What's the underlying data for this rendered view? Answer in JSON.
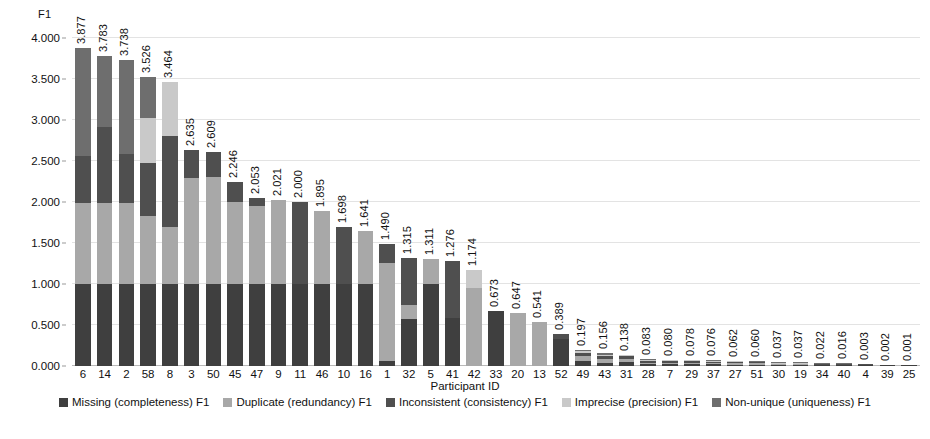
{
  "chart_data": {
    "type": "bar",
    "subtype": "stacked-bar",
    "title": "",
    "xlabel": "Participant ID",
    "ylabel": "F1",
    "ylim": [
      0.0,
      4.0
    ],
    "ytick_labels": [
      "0.000",
      "0.500",
      "1.000",
      "1.500",
      "2.000",
      "2.500",
      "3.000",
      "3.500",
      "4.000"
    ],
    "ytick_values": [
      0.0,
      0.5,
      1.0,
      1.5,
      2.0,
      2.5,
      3.0,
      3.5,
      4.0
    ],
    "grid": true,
    "legend_position": "bottom",
    "categories": [
      "6",
      "14",
      "2",
      "58",
      "8",
      "3",
      "50",
      "45",
      "47",
      "9",
      "11",
      "46",
      "10",
      "16",
      "1",
      "32",
      "5",
      "41",
      "42",
      "33",
      "20",
      "13",
      "52",
      "49",
      "43",
      "31",
      "28",
      "7",
      "29",
      "37",
      "27",
      "51",
      "30",
      "19",
      "34",
      "40",
      "4",
      "39",
      "25"
    ],
    "totals": [
      3.877,
      3.783,
      3.738,
      3.526,
      3.464,
      2.635,
      2.609,
      2.246,
      2.053,
      2.021,
      2.0,
      1.895,
      1.698,
      1.641,
      1.49,
      1.315,
      1.311,
      1.276,
      1.174,
      0.673,
      0.647,
      0.541,
      0.389,
      0.197,
      0.156,
      0.138,
      0.083,
      0.08,
      0.078,
      0.076,
      0.062,
      0.06,
      0.037,
      0.037,
      0.022,
      0.016,
      0.003,
      0.002,
      0.001
    ],
    "total_labels": [
      "3.877",
      "3.783",
      "3.738",
      "3.526",
      "3.464",
      "2.635",
      "2.609",
      "2.246",
      "2.053",
      "2.021",
      "2.000",
      "1.895",
      "1.698",
      "1.641",
      "1.490",
      "1.315",
      "1.311",
      "1.276",
      "1.174",
      "0.673",
      "0.647",
      "0.541",
      "0.389",
      "0.197",
      "0.156",
      "0.138",
      "0.083",
      "0.080",
      "0.078",
      "0.076",
      "0.062",
      "0.060",
      "0.037",
      "0.037",
      "0.022",
      "0.016",
      "0.003",
      "0.002",
      "0.001"
    ],
    "series": [
      {
        "name": "Missing (completeness) F1",
        "color": "#3f3f3f",
        "values": [
          1.0,
          1.0,
          1.0,
          1.0,
          1.0,
          1.0,
          1.0,
          1.0,
          1.0,
          1.0,
          1.0,
          1.0,
          1.0,
          1.0,
          0.06,
          1.0,
          1.0,
          0.59,
          0.0,
          0.673,
          0.0,
          0.0,
          0.33,
          0.06,
          0.04,
          0.05,
          0.02,
          0.02,
          0.02,
          0.02,
          0.018,
          0.016,
          0.012,
          0.012,
          0.008,
          0.006,
          0.001,
          0.001,
          0.001
        ]
      },
      {
        "name": "Duplicate (redundancy) F1",
        "color": "#a8a8a8",
        "values": [
          0.985,
          0.985,
          0.985,
          0.835,
          0.7,
          1.29,
          1.31,
          1.0,
          0.95,
          1.021,
          0.0,
          0.895,
          0.0,
          0.641,
          1.2,
          0.315,
          0.311,
          0.0,
          0.95,
          0.0,
          0.647,
          0.541,
          0.0,
          0.06,
          0.045,
          0.04,
          0.02,
          0.02,
          0.02,
          0.018,
          0.016,
          0.016,
          0.01,
          0.01,
          0.006,
          0.004,
          0.001,
          0.0,
          0.0
        ]
      },
      {
        "name": "Inconsistent (consistency) F1",
        "color": "#4f4f4f",
        "values": [
          0.58,
          0.93,
          0.6,
          0.64,
          1.1,
          0.345,
          0.299,
          0.246,
          0.103,
          0.0,
          1.0,
          0.0,
          0.698,
          0.0,
          0.23,
          1.0,
          0.0,
          0.686,
          0.0,
          0.0,
          0.0,
          0.0,
          0.059,
          0.04,
          0.035,
          0.03,
          0.018,
          0.018,
          0.016,
          0.016,
          0.014,
          0.014,
          0.008,
          0.008,
          0.005,
          0.003,
          0.001,
          0.001,
          0.0
        ]
      },
      {
        "name": "Imprecise (precision) F1",
        "color": "#c9c9c9",
        "values": [
          0.0,
          0.0,
          0.0,
          0.551,
          0.664,
          0.0,
          0.0,
          0.0,
          0.0,
          0.0,
          0.0,
          0.0,
          0.0,
          0.0,
          0.0,
          0.0,
          0.0,
          0.0,
          0.224,
          0.0,
          0.0,
          0.0,
          0.0,
          0.022,
          0.02,
          0.012,
          0.015,
          0.012,
          0.012,
          0.012,
          0.008,
          0.008,
          0.004,
          0.004,
          0.002,
          0.002,
          0.0,
          0.0,
          0.0
        ]
      },
      {
        "name": "Non-unique (uniqueness) F1",
        "color": "#6e6e6e",
        "values": [
          1.312,
          0.868,
          1.153,
          0.5,
          0.0,
          0.0,
          0.0,
          0.0,
          0.0,
          0.0,
          0.0,
          0.0,
          0.0,
          0.0,
          0.0,
          0.0,
          0.0,
          0.0,
          0.0,
          0.0,
          0.0,
          0.0,
          0.0,
          0.015,
          0.016,
          0.006,
          0.01,
          0.01,
          0.01,
          0.01,
          0.006,
          0.006,
          0.003,
          0.003,
          0.001,
          0.001,
          0.0,
          0.0,
          0.0
        ]
      }
    ]
  },
  "axes": {
    "y_title": "F1",
    "x_title": "Participant ID"
  }
}
